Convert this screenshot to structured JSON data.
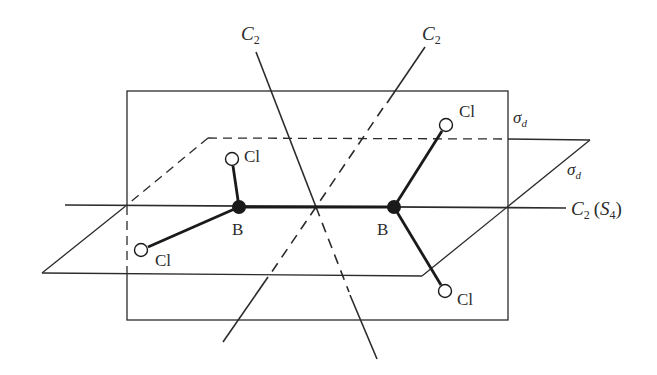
{
  "diagram": {
    "colors": {
      "line": "#2b2b2b",
      "background": "#ffffff",
      "atom_B": "#1a1a1a",
      "atom_Cl": "#ffffff"
    },
    "atoms": [
      {
        "id": "B1",
        "label": "B",
        "x": 239,
        "y": 207,
        "filled": true
      },
      {
        "id": "B2",
        "label": "B",
        "x": 394,
        "y": 207,
        "filled": true
      },
      {
        "id": "Cl1",
        "label": "Cl",
        "x": 232,
        "y": 159,
        "filled": false
      },
      {
        "id": "Cl2",
        "label": "Cl",
        "x": 141,
        "y": 250,
        "filled": false
      },
      {
        "id": "Cl3",
        "label": "Cl",
        "x": 446,
        "y": 125,
        "filled": false
      },
      {
        "id": "Cl4",
        "label": "Cl",
        "x": 445,
        "y": 291,
        "filled": false
      }
    ],
    "labels": {
      "c2_left": {
        "main": "C",
        "sub": "2"
      },
      "c2_right": {
        "main": "C",
        "sub": "2"
      },
      "c2_principal": {
        "main": "C",
        "sub": "2",
        "paren_main": "S",
        "paren_sub": "4"
      },
      "sigma_d_vertical": {
        "main": "σ",
        "sub": "d"
      },
      "sigma_d_horizontal": {
        "main": "σ",
        "sub": "d"
      },
      "B1": "B",
      "B2": "B",
      "Cl1": "Cl",
      "Cl2": "Cl",
      "Cl3": "Cl",
      "Cl4": "Cl"
    }
  }
}
